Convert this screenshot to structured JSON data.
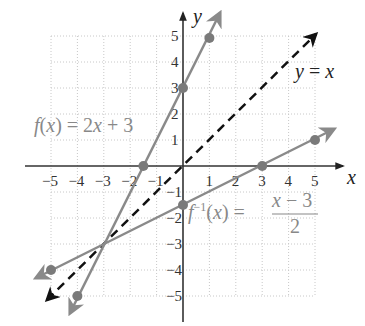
{
  "chart_data": {
    "type": "line",
    "title": "",
    "xlabel": "x",
    "ylabel": "y",
    "xlim": [
      -5,
      5
    ],
    "ylim": [
      -5,
      5
    ],
    "grid": true,
    "x_ticks": [
      "−5",
      "−4",
      "−3",
      "−2",
      "−1",
      "1",
      "2",
      "3",
      "4",
      "5"
    ],
    "y_ticks": [
      "5",
      "4",
      "3",
      "2",
      "1",
      "−1",
      "−2",
      "−3",
      "−4",
      "−5"
    ],
    "series": [
      {
        "name": "f(x) = 2x + 3",
        "style": "solid",
        "color": "#8a8a8a",
        "points": [
          [
            -4,
            -5
          ],
          [
            -1.5,
            0
          ],
          [
            0,
            3
          ],
          [
            1,
            5
          ]
        ]
      },
      {
        "name": "f⁻¹(x) = (x − 3)/2",
        "style": "solid",
        "color": "#8a8a8a",
        "points": [
          [
            -5,
            -4
          ],
          [
            0,
            -1.5
          ],
          [
            3,
            0
          ],
          [
            5,
            1
          ]
        ]
      },
      {
        "name": "y = x",
        "style": "dashed",
        "color": "#111111",
        "points": [
          [
            -5.2,
            -5.2
          ],
          [
            5.2,
            5.2
          ]
        ]
      }
    ],
    "intersection": [
      -3,
      -3
    ],
    "annotations": [
      {
        "text": "f(x) = 2x + 3",
        "x": -4.1,
        "y": 1.1
      },
      {
        "text": "y = x",
        "x": 4.3,
        "y": 3.5
      },
      {
        "text": "f⁻¹(x) = (x − 3)/2",
        "x": 0.3,
        "y": -1.9
      }
    ]
  },
  "labels": {
    "x_axis": "x",
    "y_axis": "y",
    "f_label_main": "f(x) = 2x + 3",
    "identity_label": "y = x",
    "finv_lhs_f": "f",
    "finv_lhs_sup": "−1",
    "finv_lhs_arg": "(x) =",
    "finv_num": "x − 3",
    "finv_den": "2"
  }
}
